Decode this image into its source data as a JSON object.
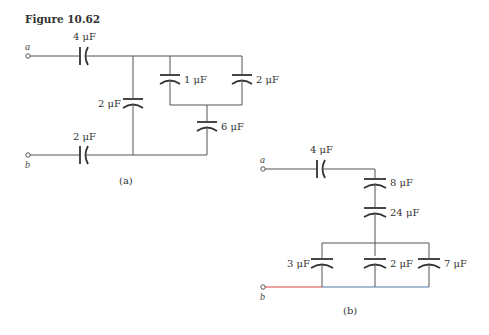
{
  "figure": {
    "title": "Figure 10.62",
    "colors": {
      "wire": "#555555",
      "plate": "#333333",
      "b_lead_red": "#d04040",
      "b_lead_blue": "#5577aa"
    }
  },
  "circuit_a": {
    "caption": "(a)",
    "terminal_a": "a",
    "terminal_b": "b",
    "capacitors": [
      {
        "id": "c-a-series-top",
        "label": "4 μF"
      },
      {
        "id": "c-a-series-bottom",
        "label": "2 μF"
      },
      {
        "id": "c-a-shunt",
        "label": "2 μF"
      },
      {
        "id": "c-a-parallel-1",
        "label": "1 μF"
      },
      {
        "id": "c-a-parallel-2",
        "label": "2 μF"
      },
      {
        "id": "c-a-lower",
        "label": "6  μF"
      }
    ]
  },
  "circuit_b": {
    "caption": "(b)",
    "terminal_a": "a",
    "terminal_b": "b",
    "capacitors": [
      {
        "id": "c-b-series-top",
        "label": "4 μF"
      },
      {
        "id": "c-b-series-8",
        "label": "8 μF"
      },
      {
        "id": "c-b-series-24",
        "label": "24 μF"
      },
      {
        "id": "c-b-parallel-3",
        "label": "3 μF"
      },
      {
        "id": "c-b-parallel-2",
        "label": "2 μF"
      },
      {
        "id": "c-b-parallel-7",
        "label": "7 μF"
      }
    ]
  }
}
